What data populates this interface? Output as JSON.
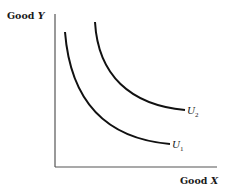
{
  "chart_data": {
    "type": "line",
    "title": "",
    "xlabel": "Good X",
    "ylabel": "Good Y",
    "xlabel_parts": {
      "text": "Good ",
      "var": "X"
    },
    "ylabel_parts": {
      "text": "Good ",
      "var": "Y"
    },
    "grid": false,
    "legend": "none",
    "series": [
      {
        "name": "U1",
        "label_main": "U",
        "label_sub": "1",
        "type": "indifference-curve",
        "level": 1
      },
      {
        "name": "U2",
        "label_main": "U",
        "label_sub": "2",
        "type": "indifference-curve",
        "level": 2
      }
    ],
    "colors": {
      "axis": "#555555",
      "curve": "#111111",
      "text": "#1a1a1a"
    }
  }
}
